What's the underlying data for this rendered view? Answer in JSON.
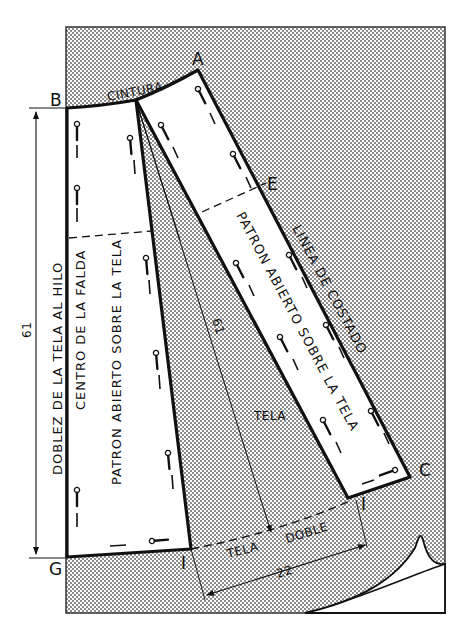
{
  "diagram": {
    "type": "sewing pattern layout",
    "points": {
      "A": "A",
      "B": "B",
      "C": "C",
      "E": "E",
      "G": "G",
      "I_left": "I",
      "I_right": "I"
    },
    "labels": {
      "waist": "CINTURA",
      "fold": "DOBLEZ DE LA TELA AL HILO",
      "center": "CENTRO DE LA FALDA",
      "left_piece": "PATRON ABIERTO SOBRE LA TELA",
      "right_piece": "PATRON ABIERTO SOBRE LA TELA",
      "side_line": "LINEA DE COSTADO",
      "fabric": "TELA",
      "double_fabric_1": "TELA",
      "double_fabric_2": "DOBLE"
    },
    "dimensions": {
      "vertical_length": "61",
      "radius_length": "61",
      "hem_width": "22"
    },
    "colors": {
      "ink": "#111111",
      "paper": "#ffffff",
      "fabric_dots": "#555555"
    }
  }
}
